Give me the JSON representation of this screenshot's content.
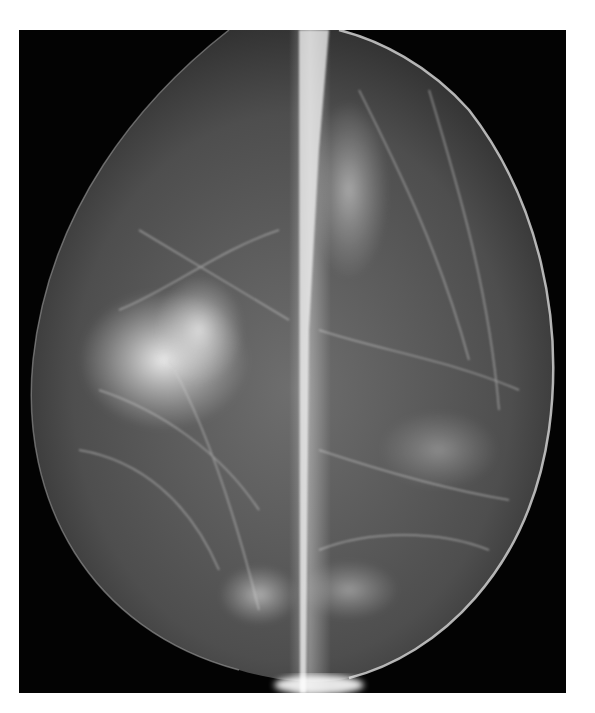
{
  "image": {
    "kind": "mammogram-composite",
    "description": "Two half-views of a breast X-ray (mammogram) joined side by side with a bright vertical seam",
    "panels": [
      {
        "side": "left",
        "feature": "dense irregular bright fibroglandular region mid-left"
      },
      {
        "side": "right",
        "feature": "scattered fibroglandular strands, bright band along seam"
      }
    ],
    "colors": {
      "background": "#030303",
      "tissue": "#5a5a5a",
      "dense": "#e8e8e8",
      "page": "#ffffff"
    }
  }
}
